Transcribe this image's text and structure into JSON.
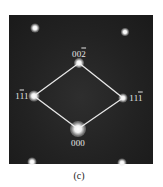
{
  "figure": {
    "caption": "(c)",
    "colors": {
      "background": "#1f1f1f",
      "lines": "#e8e8e8",
      "spots": "#ffffff",
      "labels": "#e6e6e6"
    }
  },
  "reflections": [
    {
      "id": "002",
      "label_main": "00",
      "label_bar": "2",
      "label_suffix": "",
      "x": 79,
      "y": 63,
      "size": 10
    },
    {
      "id": "1-11",
      "label_main": "1",
      "label_bar": "1",
      "label_suffix": "1",
      "x": 34,
      "y": 96,
      "size": 11
    },
    {
      "id": "11-1",
      "label_main": "11",
      "label_bar": "1",
      "label_suffix": "",
      "x": 123,
      "y": 98,
      "size": 9
    },
    {
      "id": "000",
      "label_main": "000",
      "label_bar": "",
      "label_suffix": "",
      "x": 78,
      "y": 129,
      "size": 16
    }
  ],
  "outer_spots": [
    {
      "x": 35,
      "y": 28,
      "size": 9
    },
    {
      "x": 125,
      "y": 32,
      "size": 8
    },
    {
      "x": 32,
      "y": 162,
      "size": 9
    },
    {
      "x": 122,
      "y": 163,
      "size": 9
    }
  ]
}
